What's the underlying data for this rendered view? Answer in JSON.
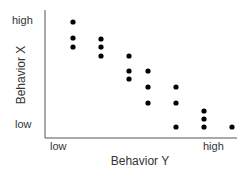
{
  "chart_data": {
    "type": "scatter",
    "title": "",
    "xlabel": "Behavior Y",
    "ylabel": "Behavior X",
    "x_tick_labels": [
      "low",
      "high"
    ],
    "y_tick_labels": [
      "low",
      "high"
    ],
    "grid": false,
    "legend": null,
    "xlim": [
      0,
      7
    ],
    "ylim": [
      0,
      8
    ],
    "note": "Qualitative axes; values are relative positions (x: column 1-7 from low to high Behavior Y; y: 0=low, 8=high Behavior X)",
    "points": [
      {
        "x": 1,
        "y": 8.0
      },
      {
        "x": 1,
        "y": 7.0
      },
      {
        "x": 1,
        "y": 6.5
      },
      {
        "x": 2,
        "y": 7.0
      },
      {
        "x": 2,
        "y": 6.5
      },
      {
        "x": 2,
        "y": 6.0
      },
      {
        "x": 3,
        "y": 6.0
      },
      {
        "x": 3,
        "y": 5.0
      },
      {
        "x": 3,
        "y": 4.5
      },
      {
        "x": 3.7,
        "y": 5.0
      },
      {
        "x": 3.7,
        "y": 4.0
      },
      {
        "x": 3.7,
        "y": 3.0
      },
      {
        "x": 4.7,
        "y": 4.0
      },
      {
        "x": 4.7,
        "y": 3.0
      },
      {
        "x": 4.7,
        "y": 1.5
      },
      {
        "x": 5.7,
        "y": 2.5
      },
      {
        "x": 5.7,
        "y": 2.0
      },
      {
        "x": 5.7,
        "y": 1.5
      },
      {
        "x": 6.7,
        "y": 1.5
      }
    ],
    "pixel_points": [
      [
        73,
        22
      ],
      [
        73,
        38
      ],
      [
        73,
        47
      ],
      [
        101,
        39
      ],
      [
        101,
        47
      ],
      [
        101,
        56
      ],
      [
        129,
        56
      ],
      [
        129,
        71
      ],
      [
        129,
        79
      ],
      [
        148,
        71
      ],
      [
        148,
        87
      ],
      [
        148,
        103
      ],
      [
        176,
        87
      ],
      [
        176,
        103
      ],
      [
        176,
        127
      ],
      [
        204,
        111
      ],
      [
        204,
        119
      ],
      [
        204,
        127
      ],
      [
        232,
        127
      ]
    ]
  },
  "axes": {
    "y_high": "high",
    "y_low": "low",
    "y_title": "Behavior X",
    "x_low": "low",
    "x_high": "high",
    "x_title": "Behavior Y",
    "color": "#555555"
  },
  "marker_color": "#000000"
}
